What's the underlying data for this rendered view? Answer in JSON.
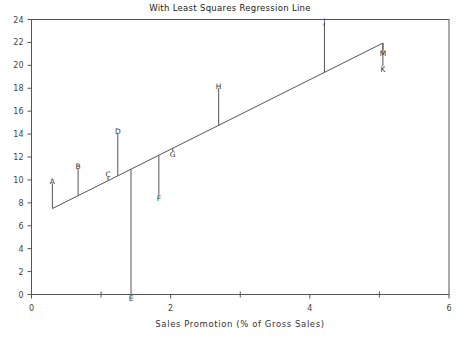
{
  "chart_data": {
    "type": "scatter",
    "title": "With Least Squares Regression Line",
    "xlabel": "Sales Promotion (% of Gross Sales)",
    "ylabel": "",
    "xlim": [
      0,
      6
    ],
    "ylim": [
      0,
      24
    ],
    "x_ticks": [
      0,
      2,
      4,
      6
    ],
    "x_minor_ticks": [
      1,
      3,
      5
    ],
    "y_ticks": [
      0,
      2,
      4,
      6,
      8,
      10,
      12,
      14,
      16,
      18,
      20,
      22,
      24
    ],
    "grid": false,
    "legend": "none",
    "points": [
      {
        "label": "A",
        "x": 0.3,
        "y": 9.7
      },
      {
        "label": "B",
        "x": 0.67,
        "y": 11.0
      },
      {
        "label": "C",
        "x": 1.1,
        "y": 10.3
      },
      {
        "label": "D",
        "x": 1.24,
        "y": 14.1
      },
      {
        "label": "E",
        "x": 1.43,
        "y": 0.0
      },
      {
        "label": "F",
        "x": 1.83,
        "y": 8.7
      },
      {
        "label": "G",
        "x": 2.03,
        "y": 12.5
      },
      {
        "label": "H",
        "x": 2.69,
        "y": 18.0
      },
      {
        "label": "J",
        "x": 4.21,
        "y": 23.7
      },
      {
        "label": "K",
        "x": 5.05,
        "y": 19.9
      },
      {
        "label": "M",
        "x": 5.05,
        "y": 21.3
      }
    ],
    "regression_line": {
      "slope": 3.04,
      "intercept": 6.59,
      "x_start": 0.3,
      "x_end": 5.05
    },
    "residual_lines": true
  },
  "colors": {
    "axis": "#555555",
    "line": "#555555",
    "text": "#333333",
    "background": "#ffffff"
  }
}
